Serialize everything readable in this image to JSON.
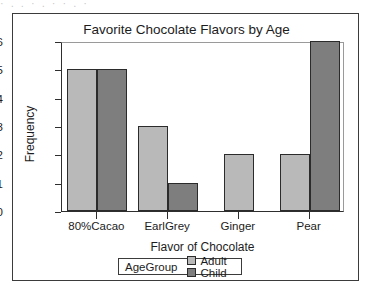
{
  "figure": {
    "scan_artifact_text": "· , . · , ·  · ,  ·"
  },
  "chart_data": {
    "type": "bar",
    "title": "Favorite Chocolate Flavors by Age",
    "xlabel": "Flavor of Chocolate",
    "ylabel": "Frequency",
    "categories": [
      "80%Cacao",
      "EarlGrey",
      "Ginger",
      "Pear"
    ],
    "series": [
      {
        "name": "Adult",
        "color": "#b9b9b9",
        "values": [
          5,
          3,
          2,
          2
        ]
      },
      {
        "name": "Child",
        "color": "#7e7e7e",
        "values": [
          5,
          1,
          null,
          6
        ]
      }
    ],
    "legend_title": "AgeGroup",
    "legend_position": "bottom",
    "ylim": [
      0,
      6
    ],
    "yticks": [
      0,
      1,
      2,
      3,
      4,
      5,
      6
    ],
    "ytick_labels": [
      "0",
      "1",
      "2",
      "3",
      "4",
      "5",
      "6"
    ],
    "grid": false,
    "bar_border_color": "#2b2b2b",
    "axis_color": "#2e2e2e"
  }
}
